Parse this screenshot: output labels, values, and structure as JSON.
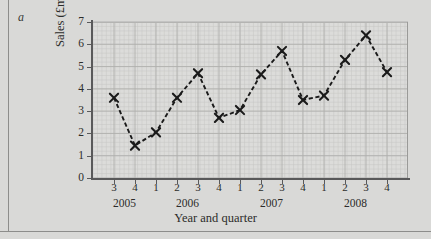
{
  "figure": {
    "panel_label": "a",
    "background_color": "#d9d9d7",
    "plot_background_color": "#dcdcda",
    "series_color": "#1a1a1a",
    "axis_color": "#59595a",
    "grid_major_color": "#b0b0ae",
    "grid_minor_color": "#c6c6c4"
  },
  "chart_data": {
    "type": "line",
    "title": "",
    "xlabel": "Year and quarter",
    "ylabel": "Sales (£m)",
    "ylim": [
      0,
      7
    ],
    "yticks": [
      0,
      1,
      2,
      3,
      4,
      5,
      6,
      7
    ],
    "ytick_labels": [
      "0",
      "1",
      "2",
      "3",
      "4",
      "5",
      "6",
      "7"
    ],
    "grid": true,
    "legend": "none",
    "marker": "x",
    "linestyle": "dashed",
    "categories": [
      "2005 Q3",
      "2005 Q4",
      "2006 Q1",
      "2006 Q2",
      "2006 Q3",
      "2006 Q4",
      "2007 Q1",
      "2007 Q2",
      "2007 Q3",
      "2007 Q4",
      "2008 Q1",
      "2008 Q2",
      "2008 Q3",
      "2008 Q4"
    ],
    "quarter_labels": [
      "3",
      "4",
      "1",
      "2",
      "3",
      "4",
      "1",
      "2",
      "3",
      "4",
      "1",
      "2",
      "3",
      "4"
    ],
    "year_groups": [
      {
        "label": "2005",
        "quarters": [
          "3",
          "4"
        ]
      },
      {
        "label": "2006",
        "quarters": [
          "1",
          "2",
          "3",
          "4"
        ]
      },
      {
        "label": "2007",
        "quarters": [
          "1",
          "2",
          "3",
          "4"
        ]
      },
      {
        "label": "2008",
        "quarters": [
          "1",
          "2",
          "3",
          "4"
        ]
      }
    ],
    "values": [
      3.6,
      1.45,
      2.05,
      3.6,
      4.7,
      2.7,
      3.05,
      4.65,
      5.7,
      3.5,
      3.7,
      5.3,
      6.4,
      4.75
    ]
  }
}
